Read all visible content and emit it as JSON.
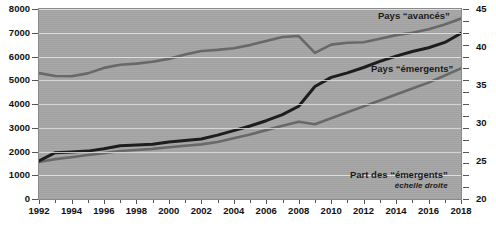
{
  "chart_data": {
    "type": "line",
    "title": "",
    "xlabel": "",
    "ylabel": "",
    "grid": true,
    "legend_position": "inline-right",
    "x": [
      1992,
      1993,
      1994,
      1995,
      1996,
      1997,
      1998,
      1999,
      2000,
      2001,
      2002,
      2003,
      2004,
      2005,
      2006,
      2007,
      2008,
      2009,
      2010,
      2011,
      2012,
      2013,
      2014,
      2015,
      2016,
      2017,
      2018
    ],
    "axis_left": {
      "label": "",
      "min": 0,
      "max": 8000,
      "step": 1000,
      "ticks": [
        "0",
        "1000",
        "2000",
        "3000",
        "4000",
        "5000",
        "6000",
        "7000",
        "8000"
      ]
    },
    "axis_right": {
      "label": "",
      "min": 20,
      "max": 45,
      "step": 5,
      "ticks": [
        "20",
        "25",
        "30",
        "35",
        "40",
        "45"
      ]
    },
    "axis_x": {
      "min": 1992,
      "max": 2018,
      "step": 2,
      "ticks": [
        "1992",
        "1994",
        "1996",
        "1998",
        "2000",
        "2002",
        "2004",
        "2006",
        "2008",
        "2010",
        "2012",
        "2014",
        "2016",
        "2018"
      ]
    },
    "series": [
      {
        "name": "Pays “avancés”",
        "axis": "left",
        "color": "#6b6b6b",
        "label": "Pays “avancés”",
        "values": [
          5300,
          5180,
          5170,
          5290,
          5520,
          5650,
          5700,
          5780,
          5900,
          6080,
          6230,
          6280,
          6350,
          6480,
          6650,
          6820,
          6860,
          6150,
          6500,
          6580,
          6600,
          6750,
          6900,
          7000,
          7150,
          7350,
          7600
        ]
      },
      {
        "name": "Pays “émergents”",
        "axis": "left",
        "color": "#6b6b6b",
        "label": "Pays “émergents”",
        "values": [
          1560,
          1680,
          1760,
          1850,
          1930,
          2020,
          2060,
          2110,
          2180,
          2240,
          2300,
          2400,
          2560,
          2720,
          2900,
          3080,
          3250,
          3150,
          3400,
          3650,
          3900,
          4150,
          4400,
          4650,
          4900,
          5200,
          5500
        ]
      },
      {
        "name": "Part des “émergents”",
        "axis": "right",
        "color": "#1e1e1e",
        "label": "Part des “émergents”",
        "sublabel": "échelle droite",
        "unit": "%",
        "values": [
          25.0,
          26.1,
          26.2,
          26.3,
          26.6,
          27.0,
          27.1,
          27.2,
          27.5,
          27.7,
          27.9,
          28.4,
          29.0,
          29.6,
          30.3,
          31.1,
          32.2,
          34.8,
          36.0,
          36.6,
          37.3,
          38.1,
          38.8,
          39.4,
          39.9,
          40.6,
          41.8
        ]
      }
    ],
    "annotations": [
      {
        "text": "Pays “avancés”"
      },
      {
        "text": "Pays “émergents”"
      },
      {
        "text": "Part des “émergents”",
        "sub": "échelle droite"
      }
    ],
    "colors": {
      "plot_background": "#a9a9a9",
      "gridline": "#e9e9e9",
      "advanced_line": "#6b6b6b",
      "emerging_line": "#6b6b6b",
      "share_line": "#1e1e1e",
      "text": "#111111",
      "page_background": "#ffffff"
    }
  }
}
